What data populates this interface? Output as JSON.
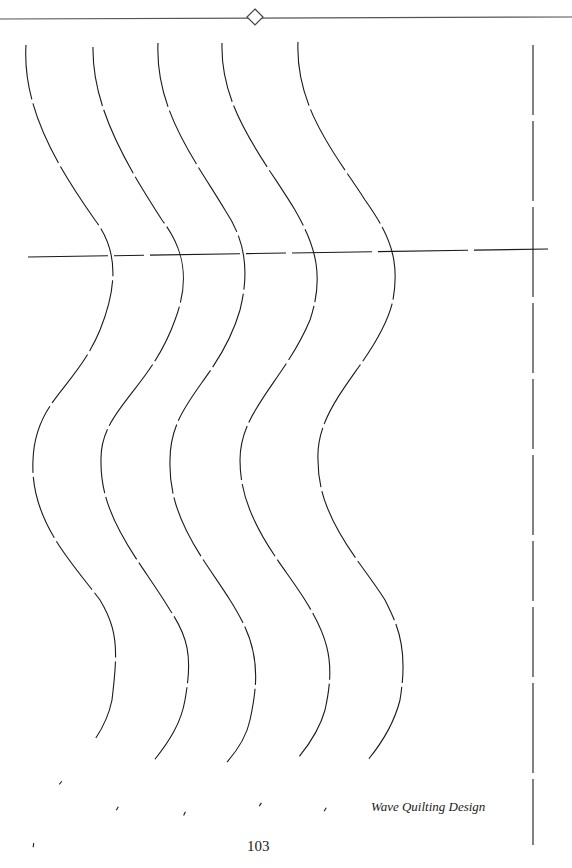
{
  "page": {
    "caption": "Wave Quilting Design",
    "page_number": "103"
  },
  "colors": {
    "ink": "#1a1a1a",
    "rule": "#555555",
    "background": "#ffffff"
  },
  "ornament": {
    "type": "diamond-icon",
    "cx": 255,
    "cy": 17,
    "r": 8
  },
  "top_rule": {
    "x1": 0,
    "y1": 19,
    "x2": 572,
    "y2": 17
  },
  "horizontal_guide": {
    "x1": 28,
    "y1": 257,
    "x2": 548,
    "y2": 249,
    "dash": "80 6 30 6 90 6 40 6 80 6 90 6 200"
  },
  "vertical_guide": {
    "x": 533,
    "y1": 45,
    "y2": 845,
    "dash": "70 6 80 6 90 6 70 6 70 6 80 6 60 6 70 6 90 6 80 6 80"
  },
  "waves": [
    {
      "d": "M26,45 C22,110 60,170 95,220 C118,250 118,285 100,330 C75,390 35,400 33,460 C30,520 70,560 100,600 C118,630 118,650 112,700 C100,760 38,780 33,850",
      "dash": "55 4 65 4 70 4 50 4 75 4 60 4 70 4 65 4 60 4 70 4 80"
    },
    {
      "d": "M93,47 C92,110 130,170 162,220 C185,250 190,280 175,320 C150,390 100,410 101,460 C100,520 140,560 170,610 C190,640 192,660 185,700 C175,760 108,790 106,845",
      "dash": "60 4 70 4 55 4 80 4 60 4 75 4 65 4 70 4 60 4 70 4 80"
    },
    {
      "d": "M158,43 C155,110 195,160 225,210 C245,240 250,270 240,310 C220,380 170,400 170,460 C168,520 205,560 230,600 C255,640 262,665 250,720 C240,770 178,790 177,843",
      "dash": "65 4 60 4 75 4 55 4 80 4 60 4 70 4 65 4 75 4 60 4 80"
    },
    {
      "d": "M222,43 C220,110 265,160 295,210 C315,245 325,275 310,320 C285,380 240,410 240,460 C240,520 280,560 305,600 C330,640 335,665 325,710 C310,765 250,790 246,845",
      "dash": "60 4 70 4 65 4 75 4 60 4 70 4 55 4 80 4 60 4 70 4 80"
    },
    {
      "d": "M298,42 C295,110 340,160 365,200 C390,235 400,260 393,300 C380,360 315,400 318,460 C318,520 360,560 385,600 C400,630 408,650 400,700 C385,760 330,790 320,820",
      "dash": "65 4 70 4 60 4 75 4 65 4 70 4 60 4 75 4 70 4 60 4 80"
    }
  ]
}
